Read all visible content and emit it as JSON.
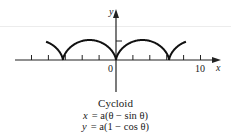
{
  "figure": {
    "title": "Cycloid",
    "equations": [
      {
        "lhs": "x",
        "rhs": "= a(θ − sin θ)"
      },
      {
        "lhs": "y",
        "rhs": "= a(1 − cos θ)"
      }
    ],
    "axes": {
      "x_label": "x",
      "y_label": "y",
      "origin_label": "0",
      "x_tick_label": "10",
      "x_tick_step": 2,
      "x_ticks": [
        -10,
        -8,
        -6,
        -4,
        -2,
        2,
        4,
        6,
        8,
        10
      ]
    },
    "colors": {
      "curve": "#111111",
      "axis": "#222222",
      "text": "#1a1a1a"
    }
  },
  "chart_data": {
    "type": "line",
    "title": "Cycloid",
    "xlabel": "x",
    "ylabel": "y",
    "parametric": {
      "x": "a(θ − sin θ)",
      "y": "a(1 − cos θ)",
      "a": 1
    },
    "cusps_x": [
      -6.28,
      0,
      6.28
    ],
    "arch_height": 2,
    "xlim": [
      -12,
      12
    ],
    "x_tick_labels": [
      "0",
      "10"
    ],
    "grid": false
  }
}
